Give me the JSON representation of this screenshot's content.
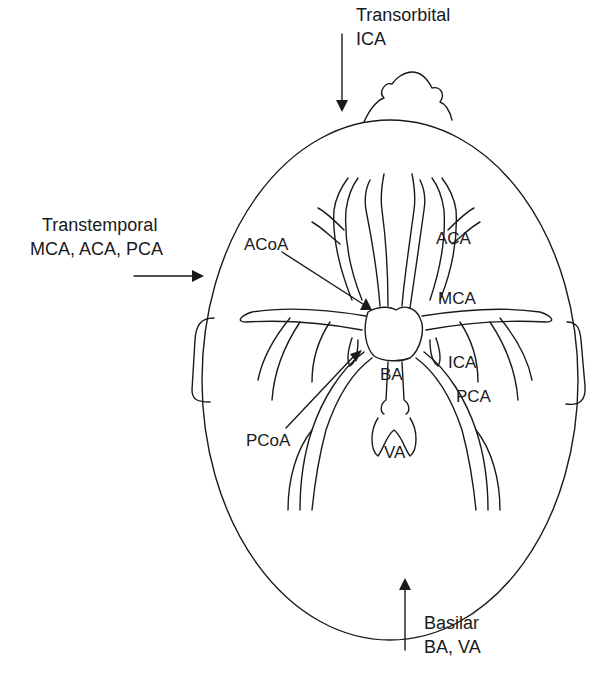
{
  "diagram": {
    "windows": [
      {
        "name": "Transorbital",
        "vessels": "ICA",
        "arrow_direction": "down"
      },
      {
        "name": "Transtemporal",
        "vessels": "MCA, ACA, PCA",
        "arrow_direction": "right"
      },
      {
        "name": "Basilar",
        "vessels": "BA, VA",
        "arrow_direction": "up"
      }
    ],
    "vessel_labels": {
      "acoa": "ACoA",
      "aca": "ACA",
      "mca": "MCA",
      "ica": "ICA",
      "ba": "BA",
      "pca": "PCA",
      "pcoa": "PCoA",
      "va": "VA"
    },
    "colors": {
      "line": "#1a1a1a",
      "background": "#ffffff"
    }
  }
}
